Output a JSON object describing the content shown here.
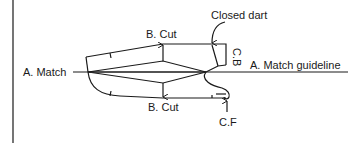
{
  "diagram": {
    "type": "pattern-cutting-diagram",
    "colors": {
      "line": "#1a1a1a",
      "background": "#ffffff"
    },
    "labels": {
      "match_left": "A. Match",
      "cut_top": "B. Cut",
      "cut_bottom": "B. Cut",
      "closed_dart": "Closed dart",
      "center_back": "C.B",
      "match_guideline": "A. Match  guideline",
      "center_front": "C.F"
    }
  }
}
